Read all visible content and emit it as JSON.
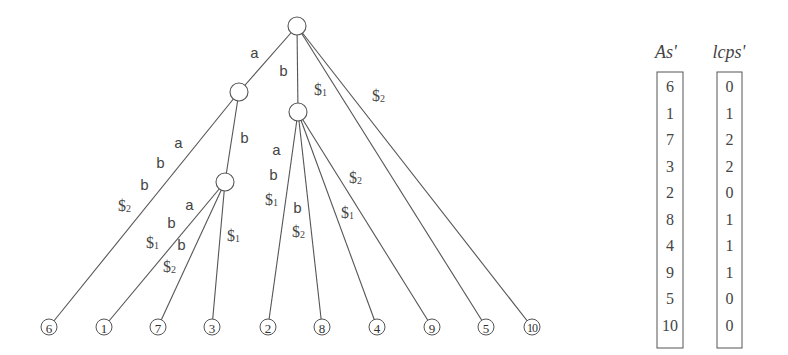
{
  "tree": {
    "internal_nodes": [
      {
        "id": "root",
        "x": 297,
        "y": 26
      },
      {
        "id": "n_a",
        "x": 239,
        "y": 92
      },
      {
        "id": "n_ab",
        "x": 225,
        "y": 182
      },
      {
        "id": "n_b",
        "x": 298,
        "y": 112
      }
    ],
    "leaves": [
      {
        "label": "6",
        "x": 49,
        "y": 327
      },
      {
        "label": "1",
        "x": 104,
        "y": 327
      },
      {
        "label": "7",
        "x": 158,
        "y": 327
      },
      {
        "label": "3",
        "x": 212,
        "y": 327
      },
      {
        "label": "2",
        "x": 268,
        "y": 327
      },
      {
        "label": "8",
        "x": 322,
        "y": 327
      },
      {
        "label": "4",
        "x": 377,
        "y": 327
      },
      {
        "label": "9",
        "x": 432,
        "y": 327
      },
      {
        "label": "5",
        "x": 486,
        "y": 327
      },
      {
        "label": "10",
        "x": 532,
        "y": 327
      }
    ],
    "edges": [
      {
        "from": [
          297,
          26
        ],
        "to": [
          239,
          92
        ]
      },
      {
        "from": [
          297,
          26
        ],
        "to": [
          298,
          112
        ]
      },
      {
        "from": [
          297,
          26
        ],
        "to": [
          486,
          327
        ]
      },
      {
        "from": [
          297,
          26
        ],
        "to": [
          532,
          327
        ]
      },
      {
        "from": [
          239,
          92
        ],
        "to": [
          49,
          327
        ]
      },
      {
        "from": [
          239,
          92
        ],
        "to": [
          225,
          182
        ]
      },
      {
        "from": [
          225,
          182
        ],
        "to": [
          104,
          327
        ]
      },
      {
        "from": [
          225,
          182
        ],
        "to": [
          158,
          327
        ]
      },
      {
        "from": [
          225,
          182
        ],
        "to": [
          212,
          327
        ]
      },
      {
        "from": [
          298,
          112
        ],
        "to": [
          268,
          327
        ]
      },
      {
        "from": [
          298,
          112
        ],
        "to": [
          322,
          327
        ]
      },
      {
        "from": [
          298,
          112
        ],
        "to": [
          377,
          327
        ]
      },
      {
        "from": [
          298,
          112
        ],
        "to": [
          432,
          327
        ]
      }
    ],
    "edge_labels": [
      {
        "text": "a",
        "x": 250,
        "y": 58,
        "font": "mono"
      },
      {
        "text": "b",
        "x": 279,
        "y": 76,
        "font": "mono"
      },
      {
        "text": "$",
        "sub": "1",
        "x": 314,
        "y": 95,
        "font": "serif"
      },
      {
        "text": "$",
        "sub": "2",
        "x": 372,
        "y": 101,
        "font": "serif"
      },
      {
        "text": "a",
        "x": 174,
        "y": 148,
        "font": "mono"
      },
      {
        "text": "b",
        "x": 156,
        "y": 168,
        "font": "mono"
      },
      {
        "text": "b",
        "x": 140,
        "y": 190,
        "font": "mono"
      },
      {
        "text": "$",
        "sub": "2",
        "x": 118,
        "y": 211,
        "font": "serif"
      },
      {
        "text": "b",
        "x": 240,
        "y": 143,
        "font": "mono"
      },
      {
        "text": "a",
        "x": 185,
        "y": 210,
        "font": "mono"
      },
      {
        "text": "b",
        "x": 167,
        "y": 228,
        "font": "mono"
      },
      {
        "text": "$",
        "sub": "1",
        "x": 146,
        "y": 248,
        "font": "serif"
      },
      {
        "text": "b",
        "x": 177,
        "y": 250,
        "font": "mono"
      },
      {
        "text": "$",
        "sub": "2",
        "x": 163,
        "y": 272,
        "font": "serif"
      },
      {
        "text": "$",
        "sub": "1",
        "x": 227,
        "y": 241,
        "font": "serif"
      },
      {
        "text": "a",
        "x": 272,
        "y": 155,
        "font": "mono"
      },
      {
        "text": "b",
        "x": 269,
        "y": 180,
        "font": "mono"
      },
      {
        "text": "$",
        "sub": "1",
        "x": 265,
        "y": 205,
        "font": "serif"
      },
      {
        "text": "b",
        "x": 293,
        "y": 213,
        "font": "mono"
      },
      {
        "text": "$",
        "sub": "2",
        "x": 292,
        "y": 237,
        "font": "serif"
      },
      {
        "text": "$",
        "sub": "2",
        "x": 349,
        "y": 183,
        "font": "serif"
      },
      {
        "text": "$",
        "sub": "1",
        "x": 341,
        "y": 218,
        "font": "serif"
      }
    ]
  },
  "arrays": {
    "as": {
      "header": "As'",
      "values": [
        "6",
        "1",
        "7",
        "3",
        "2",
        "8",
        "4",
        "9",
        "5",
        "10"
      ]
    },
    "lcps": {
      "header": "lcps'",
      "values": [
        "0",
        "1",
        "2",
        "2",
        "0",
        "1",
        "1",
        "1",
        "0",
        "0"
      ]
    }
  }
}
